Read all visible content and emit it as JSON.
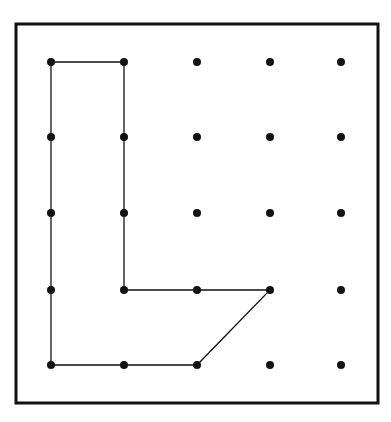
{
  "diagram": {
    "type": "geoboard",
    "grid": {
      "columns": 5,
      "rows": 5
    },
    "frame": {
      "x": 16,
      "y": 24,
      "width": 362,
      "height": 379,
      "stroke": "#111111"
    },
    "column_x": [
      51,
      124,
      197,
      270,
      341
    ],
    "row_y": [
      62,
      137,
      213,
      290,
      365
    ],
    "dot_radius": 4,
    "dot_color": "#111111",
    "shape": {
      "name": "L-shaped polygon",
      "vertices_grid": [
        [
          0,
          0
        ],
        [
          1,
          0
        ],
        [
          1,
          3
        ],
        [
          3,
          3
        ],
        [
          2,
          4
        ],
        [
          0,
          4
        ]
      ],
      "stroke": "#111111"
    }
  }
}
